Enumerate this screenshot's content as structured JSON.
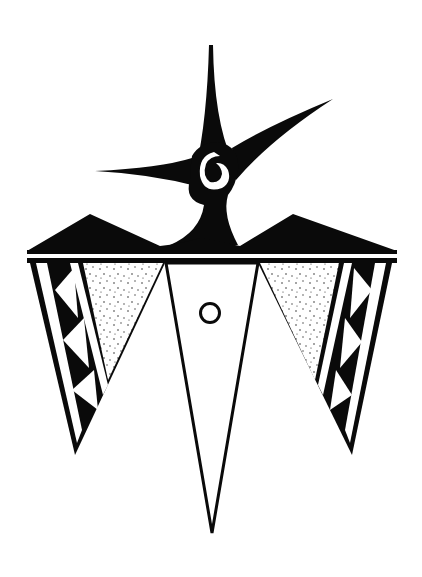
{
  "artwork": {
    "title": "Stylized bird motif",
    "description": "Black-and-white geometric bird design with spiral crest, mountain band, stippled wings and a central triangular body with a circle",
    "colors": {
      "ink": "#0a0a0a",
      "paper": "#ffffff",
      "stipple": "#333333"
    },
    "elements": {
      "crest": "spiral-star-crest",
      "band": "mountain-band",
      "left_wing": "left-wing-with-zigzag",
      "right_wing": "right-wing-with-zigzag",
      "body": "central-triangle-body",
      "eye": "circle-eye"
    }
  }
}
